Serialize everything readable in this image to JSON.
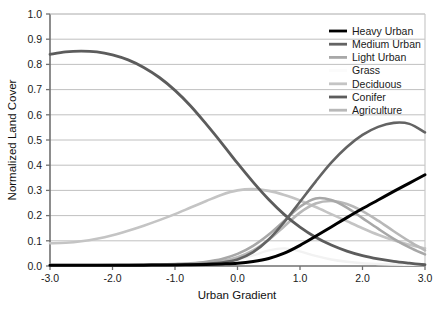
{
  "chart_data": {
    "type": "line",
    "title": "",
    "xlabel": "Urban Gradient",
    "ylabel": "Normalized Land Cover",
    "xlim": [
      -3.0,
      3.0
    ],
    "ylim": [
      0.0,
      1.0
    ],
    "grid": true,
    "grid_axis": "y",
    "legend_position": "top-right",
    "xticks": [
      "-3.0",
      "-2.0",
      "-1.0",
      "0.0",
      "1.0",
      "2.0",
      "3.0"
    ],
    "xtick_values": [
      -3.0,
      -2.0,
      -1.0,
      0.0,
      1.0,
      2.0,
      3.0
    ],
    "yticks": [
      "0.0",
      "0.1",
      "0.2",
      "0.3",
      "0.4",
      "0.5",
      "0.6",
      "0.7",
      "0.8",
      "0.9",
      "1.0"
    ],
    "ytick_values": [
      0.0,
      0.1,
      0.2,
      0.3,
      0.4,
      0.5,
      0.6,
      0.7,
      0.8,
      0.9,
      1.0
    ],
    "x": [
      -3.0,
      -2.75,
      -2.5,
      -2.25,
      -2.0,
      -1.75,
      -1.5,
      -1.25,
      -1.0,
      -0.75,
      -0.5,
      -0.25,
      0.0,
      0.25,
      0.5,
      0.75,
      1.0,
      1.25,
      1.5,
      1.75,
      2.0,
      2.25,
      2.5,
      2.75,
      3.0
    ],
    "series": [
      {
        "name": "Heavy Urban",
        "color": "#000000",
        "width": 3.0,
        "values": [
          0.003,
          0.003,
          0.003,
          0.003,
          0.003,
          0.003,
          0.003,
          0.004,
          0.004,
          0.005,
          0.006,
          0.008,
          0.011,
          0.018,
          0.03,
          0.051,
          0.082,
          0.118,
          0.155,
          0.192,
          0.228,
          0.262,
          0.296,
          0.329,
          0.362
        ]
      },
      {
        "name": "Medium Urban",
        "color": "#636363",
        "width": 2.6,
        "values": [
          0.003,
          0.003,
          0.003,
          0.003,
          0.003,
          0.003,
          0.004,
          0.004,
          0.005,
          0.006,
          0.009,
          0.014,
          0.026,
          0.055,
          0.105,
          0.175,
          0.255,
          0.335,
          0.41,
          0.472,
          0.52,
          0.552,
          0.568,
          0.564,
          0.53
        ]
      },
      {
        "name": "Light Urban",
        "color": "#a8a8a8",
        "width": 2.6,
        "values": [
          0.003,
          0.003,
          0.003,
          0.003,
          0.004,
          0.004,
          0.005,
          0.006,
          0.008,
          0.011,
          0.017,
          0.028,
          0.048,
          0.08,
          0.125,
          0.18,
          0.235,
          0.268,
          0.262,
          0.232,
          0.19,
          0.148,
          0.108,
          0.074,
          0.046
        ]
      },
      {
        "name": "Grass",
        "color": "#f2f2f2",
        "width": 2.4,
        "values": [
          0.004,
          0.004,
          0.004,
          0.004,
          0.004,
          0.005,
          0.005,
          0.006,
          0.007,
          0.009,
          0.012,
          0.017,
          0.026,
          0.042,
          0.062,
          0.07,
          0.058,
          0.04,
          0.026,
          0.017,
          0.011,
          0.008,
          0.006,
          0.005,
          0.004
        ]
      },
      {
        "name": "Deciduous",
        "color": "#c4c4c4",
        "width": 2.6,
        "values": [
          0.09,
          0.092,
          0.098,
          0.108,
          0.122,
          0.14,
          0.16,
          0.182,
          0.206,
          0.232,
          0.258,
          0.283,
          0.3,
          0.305,
          0.298,
          0.282,
          0.26,
          0.234,
          0.206,
          0.178,
          0.15,
          0.124,
          0.102,
          0.084,
          0.07
        ]
      },
      {
        "name": "Conifer",
        "color": "#5c5c5c",
        "width": 2.8,
        "values": [
          0.84,
          0.85,
          0.853,
          0.85,
          0.838,
          0.818,
          0.788,
          0.748,
          0.697,
          0.635,
          0.563,
          0.487,
          0.408,
          0.333,
          0.264,
          0.204,
          0.154,
          0.114,
          0.083,
          0.059,
          0.041,
          0.028,
          0.018,
          0.011,
          0.005
        ]
      },
      {
        "name": "Agriculture",
        "color": "#b8b8b8",
        "width": 2.6,
        "values": [
          0.004,
          0.004,
          0.004,
          0.004,
          0.004,
          0.005,
          0.005,
          0.006,
          0.007,
          0.009,
          0.013,
          0.02,
          0.035,
          0.062,
          0.104,
          0.158,
          0.212,
          0.248,
          0.258,
          0.246,
          0.218,
          0.18,
          0.138,
          0.098,
          0.062
        ]
      }
    ]
  },
  "legend": {
    "items": [
      {
        "label": "Heavy Urban",
        "color": "#000000"
      },
      {
        "label": "Medium Urban",
        "color": "#636363"
      },
      {
        "label": "Light Urban",
        "color": "#a8a8a8"
      },
      {
        "label": "Grass",
        "color": "#fbfbfb"
      },
      {
        "label": "Deciduous",
        "color": "#c4c4c4"
      },
      {
        "label": "Conifer",
        "color": "#5c5c5c"
      },
      {
        "label": "Agriculture",
        "color": "#b8b8b8"
      }
    ]
  },
  "axes": {
    "x_title": "Urban Gradient",
    "y_title": "Normalized Land Cover"
  },
  "colors": {
    "background": "#ffffff",
    "axis_line": "#808080",
    "grid_line": "#b0b0b0",
    "text": "#1a1a1a"
  }
}
